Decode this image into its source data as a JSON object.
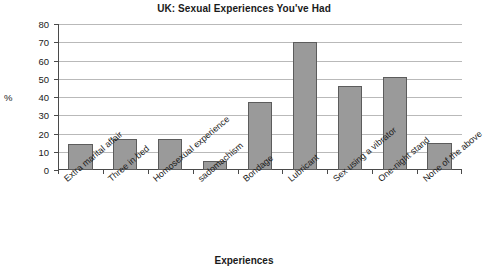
{
  "chart_data": {
    "type": "bar",
    "title": "UK: Sexual Experiences You've Had",
    "xlabel": "Experiences",
    "ylabel": "%",
    "ylim": [
      0,
      80
    ],
    "ytick_step": 10,
    "yticks": [
      0,
      10,
      20,
      30,
      40,
      50,
      60,
      70,
      80
    ],
    "grid": true,
    "legend": false,
    "categories": [
      "Extra marital affair",
      "Three in bed",
      "Homosexual experience",
      "sadomachism",
      "Bondage",
      "Lubricant",
      "Sex using a vibrator",
      "One-night stand",
      "None of the above"
    ],
    "values": [
      14,
      17,
      17,
      5,
      37,
      70,
      46,
      51,
      15
    ],
    "bar_color": "#9a9a9a",
    "bar_border_color": "#5c5c5c",
    "grid_color": "#b9b9b9",
    "axis_color": "#4a4a4a",
    "background": "#ffffff"
  }
}
